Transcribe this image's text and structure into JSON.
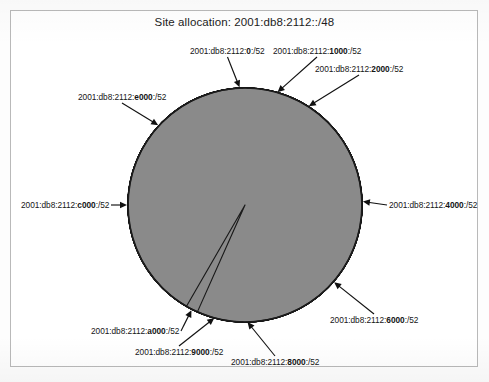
{
  "figure": {
    "title": "Site allocation: 2001:db8:2112::/48",
    "frame_color": "#b9b9b9",
    "background_color": "#ffffff"
  },
  "chart_data": {
    "type": "pie",
    "title": "Site allocation: 2001:db8:2112::/48",
    "xlabel": "",
    "ylabel": "",
    "legend_position": "none",
    "grid": false,
    "total_prefix": "2001:db8:2112::/48",
    "subnet_size": "/52",
    "allocated_slice_color": "#8a8a8a",
    "unallocated_slice_color": "#e3e3e3",
    "outline_color": "#1a1a1a",
    "center": {
      "x": 245,
      "y": 205
    },
    "radius": 117,
    "note": "Each dark wedge is one allocated /52 subnet; light regions are unallocated space.",
    "categories": [
      "2001:db8:2112:0:/52",
      "2001:db8:2112:1000:/52",
      "2001:db8:2112:2000:/52",
      "2001:db8:2112:4000:/52",
      "2001:db8:2112:6000:/52",
      "2001:db8:2112:8000:/52",
      "2001:db8:2112:9000:/52",
      "2001:db8:2112:a000:/52",
      "2001:db8:2112:c000:/52",
      "2001:db8:2112:e000:/52"
    ],
    "slices": [
      {
        "name": "2001:db8:2112:0:/52",
        "hex": "0",
        "center_angle_deg": 92,
        "width_deg": 7,
        "allocated": true
      },
      {
        "name": "2001:db8:2112:1000:/52",
        "hex": "1000",
        "center_angle_deg": 75,
        "width_deg": 6,
        "allocated": true
      },
      {
        "name": "2001:db8:2112:2000:/52",
        "hex": "2000",
        "center_angle_deg": 58,
        "width_deg": 6,
        "allocated": true
      },
      {
        "name": "2001:db8:2112:4000:/52",
        "hex": "4000",
        "center_angle_deg": 2,
        "width_deg": 6,
        "allocated": true
      },
      {
        "name": "2001:db8:2112:6000:/52",
        "hex": "6000",
        "center_angle_deg": -41,
        "width_deg": 6,
        "allocated": true
      },
      {
        "name": "2001:db8:2112:8000:/52",
        "hex": "8000",
        "center_angle_deg": -90,
        "width_deg": 6,
        "allocated": true
      },
      {
        "name": "2001:db8:2112:9000:/52",
        "hex": "9000",
        "center_angle_deg": -104,
        "width_deg": 6,
        "allocated": true
      },
      {
        "name": "2001:db8:2112:a000:/52",
        "hex": "a000",
        "center_angle_deg": -117,
        "width_deg": 6,
        "allocated": true
      },
      {
        "name": "2001:db8:2112:c000:/52",
        "hex": "c000",
        "center_angle_deg": 180,
        "width_deg": 6,
        "allocated": true
      },
      {
        "name": "2001:db8:2112:e000:/52",
        "hex": "e000",
        "center_angle_deg": 137,
        "width_deg": 6,
        "allocated": true
      }
    ],
    "values": [
      7,
      6,
      6,
      6,
      6,
      6,
      6,
      6,
      6,
      6
    ]
  },
  "callouts": [
    {
      "id": "label-0",
      "prefix": "2001:db8:2112:",
      "hex": "0",
      "suffix": ":/52",
      "x": 190,
      "y": 46,
      "align": "left"
    },
    {
      "id": "label-1000",
      "prefix": "2001:db8:2112:",
      "hex": "1000",
      "suffix": ":/52",
      "x": 273,
      "y": 46,
      "align": "left"
    },
    {
      "id": "label-2000",
      "prefix": "2001:db8:2112:",
      "hex": "2000",
      "suffix": ":/52",
      "x": 315,
      "y": 64,
      "align": "left"
    },
    {
      "id": "label-e000",
      "prefix": "2001:db8:2112:",
      "hex": "e000",
      "suffix": ":/52",
      "x": 78,
      "y": 92,
      "align": "left"
    },
    {
      "id": "label-c000",
      "prefix": "2001:db8:2112:",
      "hex": "c000",
      "suffix": ":/52",
      "x": 21,
      "y": 200,
      "align": "left"
    },
    {
      "id": "label-4000",
      "prefix": "2001:db8:2112:",
      "hex": "4000",
      "suffix": ":/52",
      "x": 389,
      "y": 200,
      "align": "left"
    },
    {
      "id": "label-6000",
      "prefix": "2001:db8:2112:",
      "hex": "6000",
      "suffix": ":/52",
      "x": 330,
      "y": 315,
      "align": "left"
    },
    {
      "id": "label-8000",
      "prefix": "2001:db8:2112:",
      "hex": "8000",
      "suffix": ":/52",
      "x": 231,
      "y": 357,
      "align": "left"
    },
    {
      "id": "label-9000",
      "prefix": "2001:db8:2112:",
      "hex": "9000",
      "suffix": ":/52",
      "x": 135,
      "y": 347,
      "align": "left"
    },
    {
      "id": "label-a000",
      "prefix": "2001:db8:2112:",
      "hex": "a000",
      "suffix": ":/52",
      "x": 91,
      "y": 326,
      "align": "left"
    }
  ]
}
